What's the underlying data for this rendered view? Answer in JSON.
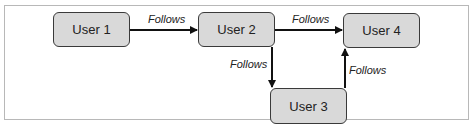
{
  "diagram": {
    "nodes": [
      {
        "id": "user1",
        "label": "User 1"
      },
      {
        "id": "user2",
        "label": "User 2"
      },
      {
        "id": "user3",
        "label": "User 3"
      },
      {
        "id": "user4",
        "label": "User 4"
      }
    ],
    "edges": [
      {
        "from": "user1",
        "to": "user2",
        "label": "Follows"
      },
      {
        "from": "user2",
        "to": "user4",
        "label": "Follows"
      },
      {
        "from": "user2",
        "to": "user3",
        "label": "Follows"
      },
      {
        "from": "user3",
        "to": "user4",
        "label": "Follows"
      }
    ],
    "colors": {
      "node_fill": "#d9d9d9",
      "node_border": "#3a3a3a",
      "edge": "#111111"
    }
  }
}
